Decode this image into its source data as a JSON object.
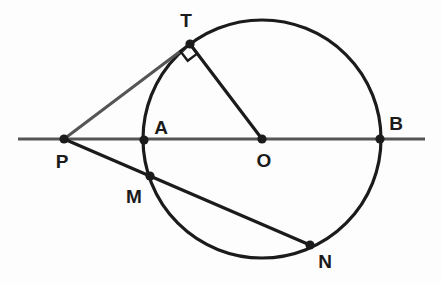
{
  "figure": {
    "canvas": {
      "width": 441,
      "height": 283
    },
    "background_color": "#fdfdfd",
    "stroke_color": "#1b1b1b",
    "secondary_stroke_color": "#555555",
    "point_fill_color": "#1b1b1b"
  },
  "labels": {
    "T": "T",
    "P": "P",
    "A": "A",
    "O": "O",
    "B": "B",
    "M": "M",
    "N": "N"
  },
  "chart_data": {
    "type": "scatter",
    "xlabel": "",
    "ylabel": "",
    "xlim": [
      0,
      441
    ],
    "ylim": [
      283,
      0
    ],
    "grid": false,
    "legend": false,
    "circle": {
      "center_label": "O",
      "cx": 262,
      "cy": 139,
      "r": 119
    },
    "points": [
      {
        "name": "T",
        "x": 190,
        "y": 44,
        "label_x": 186,
        "label_y": 27
      },
      {
        "name": "P",
        "x": 64,
        "y": 139,
        "label_x": 62,
        "label_y": 168
      },
      {
        "name": "A",
        "x": 144,
        "y": 140,
        "label_x": 161,
        "label_y": 134
      },
      {
        "name": "O",
        "x": 262,
        "y": 139,
        "label_x": 264,
        "label_y": 167
      },
      {
        "name": "B",
        "x": 380,
        "y": 139,
        "label_x": 396,
        "label_y": 130
      },
      {
        "name": "M",
        "x": 150,
        "y": 176,
        "label_x": 134,
        "label_y": 203
      },
      {
        "name": "N",
        "x": 310,
        "y": 245,
        "label_x": 325,
        "label_y": 268
      }
    ],
    "segments": [
      {
        "name": "line-PB-extended",
        "x1": 18,
        "y1": 139,
        "x2": 425,
        "y2": 139,
        "style": "secondary"
      },
      {
        "name": "tangent-PT",
        "x1": 64,
        "y1": 139,
        "x2": 190,
        "y2": 44,
        "style": "secondary"
      },
      {
        "name": "radius-TO",
        "x1": 190,
        "y1": 44,
        "x2": 262,
        "y2": 139,
        "style": "primary"
      },
      {
        "name": "secant-PN",
        "x1": 64,
        "y1": 139,
        "x2": 310,
        "y2": 245,
        "style": "primary"
      }
    ],
    "angle_markers": [
      {
        "name": "right-angle-at-T",
        "vertex": "T",
        "x": 190,
        "y": 44,
        "type": "square",
        "size": 12
      }
    ]
  }
}
